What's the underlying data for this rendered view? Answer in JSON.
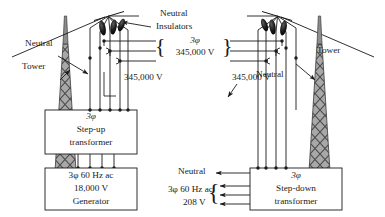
{
  "diagram": {
    "background_color": "#ffffff",
    "line_color": "#1a1a1a",
    "tower_fill_color": "#9a9a9a",
    "insulator_color": "#161616"
  },
  "labels": {
    "neutral_top": "Neutral",
    "insulators": "Insulators",
    "center_phase": "3φ",
    "center_voltage": "345,000 V",
    "left_neutral": "Neutral",
    "left_tower": "Tower",
    "left_voltage": "345,000 V",
    "right_voltage": "345,000 V",
    "right_tower": "Tower",
    "right_neutral": "Neutral",
    "out_neutral": "Neutral",
    "out_line1": "3φ 60 Hz ac",
    "out_line2": "208 V"
  },
  "boxes": {
    "step_up": {
      "line1": "3φ",
      "line2": "Step-up",
      "line3": "transformer"
    },
    "generator": {
      "line1": "3φ 60 Hz ac",
      "line2": "18,000 V",
      "line3": "Generator"
    },
    "step_down": {
      "line1": "3φ",
      "line2": "Step-down",
      "line3": "transformer"
    }
  },
  "braces": {
    "center_left": "{",
    "center_right": "}",
    "output_left": "{"
  }
}
